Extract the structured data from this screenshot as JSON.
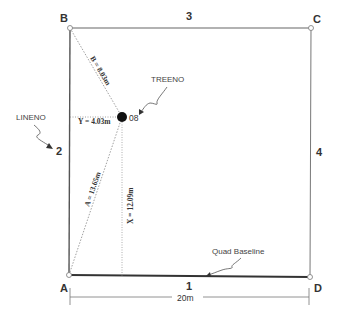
{
  "diagram": {
    "type": "quadrat-tree-location-plot",
    "corners": {
      "A": "A",
      "B": "B",
      "C": "C",
      "D": "D"
    },
    "sides": {
      "bottom": "1",
      "left": "2",
      "top": "3",
      "right": "4"
    },
    "callouts": {
      "treeno": "TREENO",
      "lineno": "LINENO",
      "baseline": "Quad Baseline"
    },
    "tree": {
      "id": "08"
    },
    "measurements": {
      "A": "A = 13.65m",
      "B": "B = 8.03m",
      "X": "X = 12.09m",
      "Y": "Y = 4.03m"
    },
    "dimension": {
      "width": "20m"
    },
    "colors": {
      "line": "#555555",
      "dotted": "#888888",
      "tree": "#111111",
      "text": "#333333"
    }
  }
}
